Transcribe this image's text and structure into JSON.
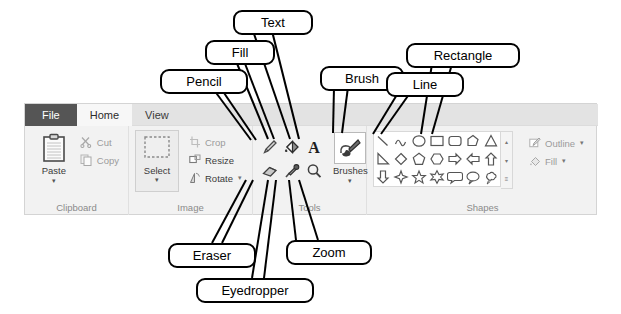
{
  "app": {
    "name": "Paint Ribbon"
  },
  "ribbon": {
    "tabs": [
      {
        "label": "File",
        "state": "file"
      },
      {
        "label": "Home",
        "state": "active"
      },
      {
        "label": "View",
        "state": "normal"
      }
    ],
    "groups": [
      {
        "label": "Clipboard",
        "big": {
          "label": "Paste",
          "icon": "clipboard-icon",
          "caret": "▾"
        },
        "items": [
          {
            "label": "Cut",
            "icon": "scissors-icon",
            "enabled": false
          },
          {
            "label": "Copy",
            "icon": "copy-icon",
            "enabled": false
          }
        ]
      },
      {
        "label": "Image",
        "select": {
          "label": "Select",
          "icon": "selection-rect-icon",
          "caret": "▾"
        },
        "items": [
          {
            "label": "Crop",
            "icon": "crop-icon",
            "enabled": false,
            "caret": ""
          },
          {
            "label": "Resize",
            "icon": "resize-icon",
            "enabled": true,
            "caret": ""
          },
          {
            "label": "Rotate",
            "icon": "rotate-icon",
            "enabled": true,
            "caret": "▾"
          }
        ]
      },
      {
        "label": "Tools",
        "tools": [
          {
            "name": "pencil-icon",
            "title": "Pencil"
          },
          {
            "name": "fill-icon",
            "title": "Fill with color"
          },
          {
            "name": "text-icon",
            "title": "Text"
          },
          {
            "name": "eraser-icon",
            "title": "Eraser"
          },
          {
            "name": "eyedropper-icon",
            "title": "Color picker"
          },
          {
            "name": "magnifier-icon",
            "title": "Magnifier"
          }
        ],
        "brushes": {
          "label": "Brushes",
          "icon": "brush-icon",
          "caret": "▾"
        }
      },
      {
        "label": "Shapes",
        "shapes": [
          "line-shape",
          "curve-shape",
          "oval-shape",
          "rectangle-shape",
          "rounded-rectangle-shape",
          "polygon-shape",
          "triangle-shape",
          "right-triangle-shape",
          "diamond-shape",
          "pentagon-shape",
          "hexagon-shape",
          "right-arrow-shape",
          "left-arrow-shape",
          "up-arrow-shape",
          "down-arrow-shape",
          "four-point-star-shape",
          "five-point-star-shape",
          "six-point-star-shape",
          "rounded-callout-shape",
          "oval-callout-shape",
          "cloud-callout-shape"
        ],
        "scroll": {
          "up": "▴",
          "down": "▾",
          "more": "≡"
        },
        "outline": {
          "label": "Outline",
          "icon": "outline-pen-icon",
          "caret": "▾"
        },
        "fill": {
          "label": "Fill",
          "icon": "fill-bucket-icon",
          "caret": "▾"
        }
      }
    ]
  },
  "callouts": [
    {
      "id": "pencil",
      "label": "Pencil",
      "x": 160,
      "y": 69,
      "w": 66
    },
    {
      "id": "fill",
      "label": "Fill",
      "x": 205,
      "y": 40,
      "w": 48
    },
    {
      "id": "text",
      "label": "Text",
      "x": 233,
      "y": 10,
      "w": 58
    },
    {
      "id": "brush",
      "label": "Brush",
      "x": 320,
      "y": 66,
      "w": 62
    },
    {
      "id": "line",
      "label": "Line",
      "x": 386,
      "y": 72,
      "w": 56
    },
    {
      "id": "rectangle",
      "label": "Rectangle",
      "x": 406,
      "y": 43,
      "w": 92
    },
    {
      "id": "eraser",
      "label": "Eraser",
      "x": 168,
      "y": 243,
      "w": 66
    },
    {
      "id": "eyedropper",
      "label": "Eyedropper",
      "x": 196,
      "y": 278,
      "w": 96
    },
    {
      "id": "zoom",
      "label": "Zoom",
      "x": 286,
      "y": 240,
      "w": 64
    }
  ]
}
